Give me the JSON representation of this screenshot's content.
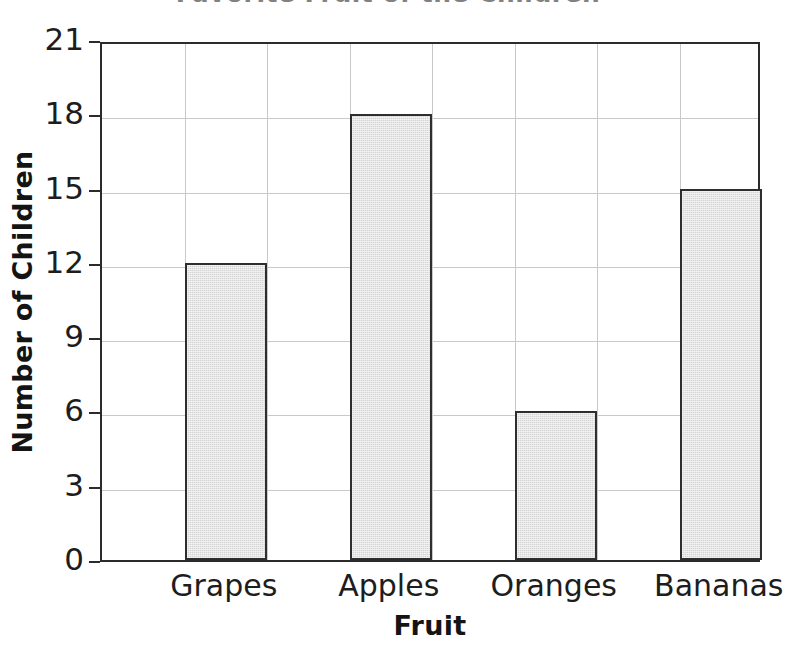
{
  "chart_data": {
    "type": "bar",
    "title": "Favorite Fruit of the Children",
    "categories": [
      "Grapes",
      "Apples",
      "Oranges",
      "Bananas"
    ],
    "values": [
      12,
      18,
      6,
      15
    ],
    "xlabel": "Fruit",
    "ylabel": "Number of Children",
    "ylim": [
      0,
      21
    ],
    "yticks": [
      0,
      3,
      6,
      9,
      12,
      15,
      18,
      21
    ],
    "ytick_labels": [
      "0",
      "3",
      "6",
      "9",
      "12",
      "15",
      "18",
      "21"
    ],
    "grid": true,
    "grid_columns": 8,
    "legend": null,
    "bar_fill_color": "#d4d4d4",
    "bar_edge_color": "#2e2e2e",
    "axis_color": "#2b2b2b",
    "grid_color": "#c9c9c9",
    "text_color": "#1d1d1d"
  }
}
